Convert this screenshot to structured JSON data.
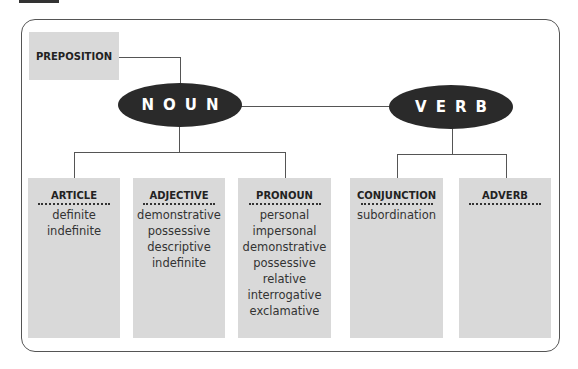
{
  "diagram": {
    "preposition": "PREPOSITION",
    "noun": "NOUN",
    "verb": "VERB",
    "categories": [
      {
        "title": "ARTICLE",
        "items": [
          "definite",
          "indefinite"
        ]
      },
      {
        "title": "ADJECTIVE",
        "items": [
          "demonstrative",
          "possessive",
          "descriptive",
          "indefinite"
        ]
      },
      {
        "title": "PRONOUN",
        "items": [
          "personal",
          "impersonal",
          "demonstrative",
          "possessive",
          "relative",
          "interrogative",
          "exclamative"
        ]
      },
      {
        "title": "CONJUNCTION",
        "items": [
          "subordination"
        ]
      },
      {
        "title": "ADVERB",
        "items": []
      }
    ],
    "colors": {
      "ellipse": "#2a2a2a",
      "box": "#d9d9d9",
      "line": "#555555"
    }
  }
}
